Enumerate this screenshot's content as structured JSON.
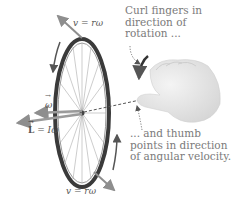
{
  "diagram": {
    "labels": {
      "v_top": "v = rω",
      "v_bottom": "v = rω",
      "omega": "ω",
      "L_eq_left": "L",
      "L_eq_right": " = Iω"
    },
    "captions": {
      "curl": "Curl fingers in\ndirection of\nrotation ...",
      "thumb": "... and thumb\npoints in direction\nof angular velocity."
    },
    "colors": {
      "wheel": "#3a3a3a",
      "spokes": "#8a8a8a",
      "arrows": "#8e8e8e",
      "text": "#6b6b6b",
      "hand": "#e8e8e8"
    }
  }
}
